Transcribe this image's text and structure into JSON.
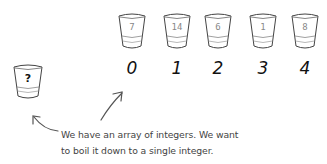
{
  "array": {
    "cups": [
      {
        "index": "0",
        "value": "7"
      },
      {
        "index": "1",
        "value": "14"
      },
      {
        "index": "2",
        "value": "6"
      },
      {
        "index": "3",
        "value": "1"
      },
      {
        "index": "4",
        "value": "8"
      }
    ]
  },
  "result_cup": {
    "value": "?"
  },
  "caption": {
    "line1": "We have an array of integers. We want",
    "line2": "to boil it down to a single integer."
  }
}
